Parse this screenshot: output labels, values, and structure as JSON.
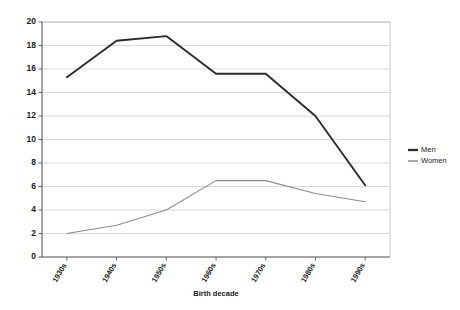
{
  "chart_data": {
    "type": "line",
    "title": "",
    "subtitle": "",
    "xlabel": "Birth decade",
    "ylabel": "",
    "categories": [
      "1930s",
      "1940s",
      "1950s",
      "1960s",
      "1970s",
      "1980s",
      "1990s"
    ],
    "series": [
      {
        "name": "Men",
        "values": [
          15.3,
          18.4,
          18.8,
          15.6,
          15.6,
          12.0,
          6.1
        ],
        "color": "#2b2b2b",
        "width": 1.9
      },
      {
        "name": "Women",
        "values": [
          2.0,
          2.7,
          4.0,
          6.5,
          6.5,
          5.4,
          4.7
        ],
        "color": "#8c8c8c",
        "width": 1.1
      }
    ],
    "ylim": [
      0,
      20
    ],
    "ytick_step": 2,
    "yticks": [
      "0",
      "2",
      "4",
      "6",
      "8",
      "10",
      "12",
      "14",
      "16",
      "18",
      "20"
    ],
    "grid": true,
    "grid_axis": "y",
    "grid_color": "#c8c8c8",
    "frame_color": "#b5b5b5",
    "axis_color": "#555555",
    "legend_position": "right",
    "background": "#ffffff",
    "xtick_rotation": -60
  },
  "legend": {
    "entries": [
      {
        "label": "Men"
      },
      {
        "label": "Women"
      }
    ]
  }
}
